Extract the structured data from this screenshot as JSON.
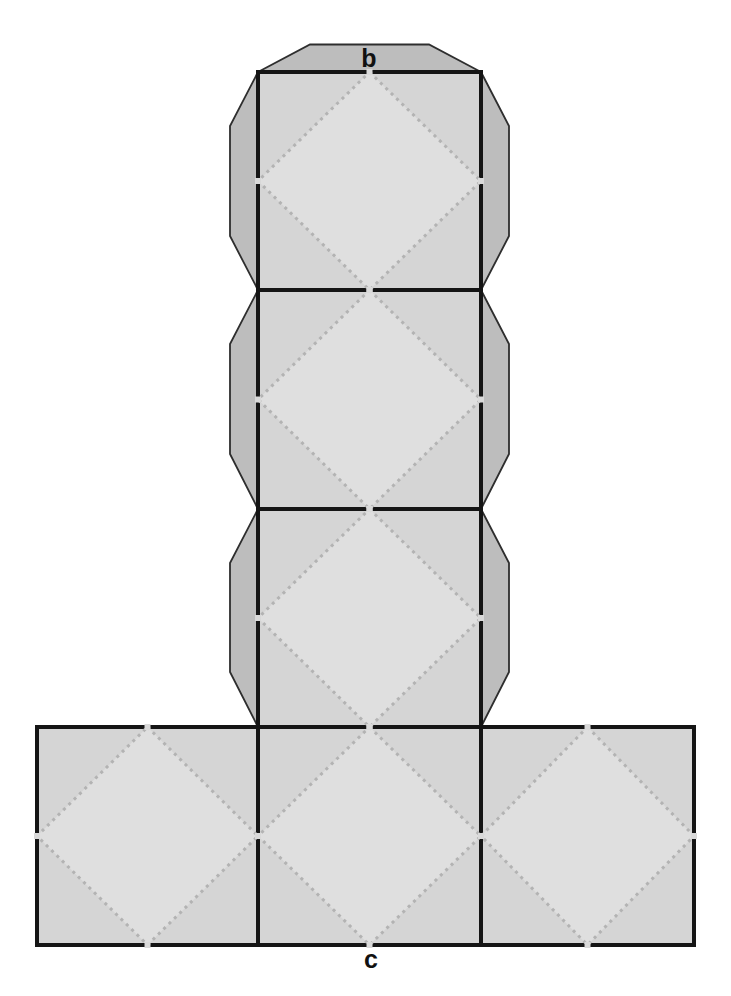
{
  "figure": {
    "type": "cube-net",
    "column_square_count": 3,
    "row_square_count": 3,
    "glue_tab_count": 7
  },
  "labels": {
    "top_tab": "b",
    "bottom_edge": "c"
  },
  "colors": {
    "background": "#ffffff",
    "square_fill": "#d5d5d5",
    "diamond_fill": "#dfdfdf",
    "tab_fill": "#bdbdbd",
    "tab_outline": "#2e2e2e",
    "border": "#151515",
    "dot": "#b3b3b3",
    "notch": "#d9d9d9",
    "label_color": "#111111"
  }
}
